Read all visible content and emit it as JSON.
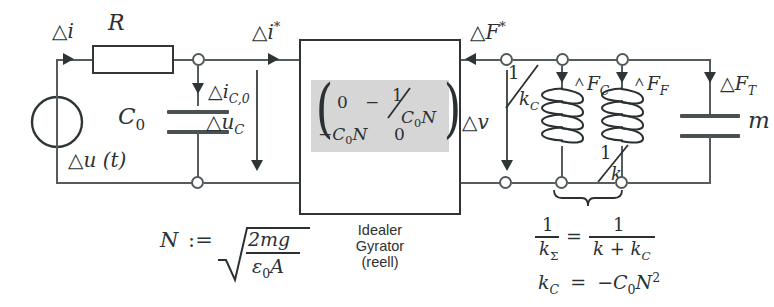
{
  "diagram": {
    "type": "electrical-mechanical-equivalent-circuit"
  },
  "source": {
    "label": "Δu (t)",
    "name": "voltage-source"
  },
  "resistor": {
    "label": "R"
  },
  "currents": {
    "input": "Δi",
    "cap_branch": "Δi",
    "cap_branch_sub": "C,0",
    "star": "Δi",
    "star_sup": "*"
  },
  "capacitor_c0": {
    "label": "C",
    "sub": "0"
  },
  "voltages": {
    "uc": "Δu",
    "uc_sub": "C",
    "v": "Δv"
  },
  "gyrator": {
    "caption_line1": "Idealer",
    "caption_line2": "Gyrator",
    "caption_line3": "(reell)",
    "matrix": {
      "m11": "0",
      "m12_sign": "−",
      "m12_num": "1",
      "m12_den": "C₀N",
      "m21": "−C₀N",
      "m22": "0"
    },
    "panel_color": "#d6d6d6"
  },
  "forces": {
    "star": "ΔF",
    "star_sup": "*",
    "fc": "ΔF",
    "fc_sub": "C",
    "ff": "ΔF",
    "ff_sub": "F",
    "ft": "ΔF",
    "ft_sub": "T"
  },
  "coils": {
    "first": {
      "num": "1",
      "den": "k",
      "den_sub": "C"
    },
    "second": {
      "num": "1",
      "den": "k",
      "den_sub": ""
    }
  },
  "mass": {
    "label": "m"
  },
  "formulas": {
    "n_def_lhs": "N",
    "n_def_assign": ":=",
    "n_def_num": "2mg",
    "n_def_den_eps": "ε",
    "n_def_den_eps_sub": "0",
    "n_def_den_a": "A",
    "stiffness_lhs_num": "1",
    "stiffness_lhs_den": "k",
    "stiffness_lhs_den_sub": "Σ",
    "stiffness_eq": "=",
    "stiffness_rhs_num": "1",
    "stiffness_rhs_den": "k + k",
    "stiffness_rhs_den_sub": "C",
    "kc_lhs": "k",
    "kc_lhs_sub": "C",
    "kc_eq": "=",
    "kc_rhs": "−C",
    "kc_rhs_sub": "0",
    "kc_rhs_n": "N",
    "kc_rhs_sup": "2"
  },
  "colors": {
    "wire": "#555c5e",
    "ink": "#2b3133",
    "panel": "#d6d6d6"
  }
}
